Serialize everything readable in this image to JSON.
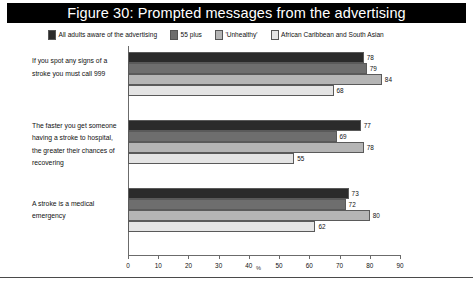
{
  "figure": {
    "title": "Figure 30: Prompted messages from the advertising"
  },
  "colors": {
    "title_band_bg": "#000000",
    "title_text": "#ffffff",
    "series_1": "#2b2b2b",
    "series_2": "#6e6e6e",
    "series_3": "#b5b5b5",
    "series_4": "#e4e4e4",
    "axis": "#6b6b6b",
    "text": "#111111"
  },
  "chart_data": {
    "type": "bar",
    "orientation": "horizontal",
    "title": "Figure 30: Prompted messages from the advertising",
    "xlabel": "%",
    "ylabel": "",
    "xlim": [
      0,
      90
    ],
    "xticks": [
      "0",
      "10",
      "20",
      "30",
      "40",
      "50",
      "60",
      "70",
      "80",
      "90"
    ],
    "grid": false,
    "legend_position": "top",
    "categories": [
      "If you spot any signs of a stroke you must call 999",
      "The faster you get someone having a stroke to hospital, the greater their chances of recovering",
      "A stroke is a medical emergency"
    ],
    "series": [
      {
        "name": "All adults aware of the advertising",
        "color": "#2b2b2b",
        "values": [
          78,
          77,
          73
        ]
      },
      {
        "name": "55 plus",
        "color": "#6e6e6e",
        "values": [
          79,
          69,
          72
        ]
      },
      {
        "name": "'Unhealthy'",
        "color": "#b5b5b5",
        "values": [
          84,
          78,
          80
        ]
      },
      {
        "name": "African Caribbean and South Asian",
        "color": "#e4e4e4",
        "values": [
          68,
          55,
          62
        ]
      }
    ]
  }
}
